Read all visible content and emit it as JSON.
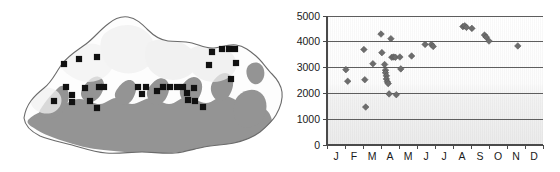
{
  "figure": {
    "panels": [
      "map-panel",
      "chart-panel"
    ]
  },
  "map": {
    "title": "Bhutan distribution map",
    "region_name": "Bhutan",
    "marker_symbol": "black-square",
    "marker_count": 40,
    "colors": {
      "outline": "#6b6b6b",
      "lowland_shading": "#8f8f8f",
      "highland_shading": "#e8e8e8",
      "marker": "#111111",
      "background": "#ffffff"
    },
    "markers": [
      {
        "x": 79,
        "y": 59
      },
      {
        "x": 64,
        "y": 64
      },
      {
        "x": 97,
        "y": 57
      },
      {
        "x": 66,
        "y": 87
      },
      {
        "x": 85,
        "y": 88
      },
      {
        "x": 99,
        "y": 87
      },
      {
        "x": 104,
        "y": 87
      },
      {
        "x": 72,
        "y": 95
      },
      {
        "x": 72,
        "y": 102
      },
      {
        "x": 54,
        "y": 101
      },
      {
        "x": 90,
        "y": 101
      },
      {
        "x": 97,
        "y": 108
      },
      {
        "x": 138,
        "y": 87
      },
      {
        "x": 146,
        "y": 87
      },
      {
        "x": 142,
        "y": 94
      },
      {
        "x": 157,
        "y": 91
      },
      {
        "x": 163,
        "y": 87
      },
      {
        "x": 170,
        "y": 87
      },
      {
        "x": 177,
        "y": 87
      },
      {
        "x": 183,
        "y": 87
      },
      {
        "x": 187,
        "y": 93
      },
      {
        "x": 194,
        "y": 88
      },
      {
        "x": 188,
        "y": 100
      },
      {
        "x": 195,
        "y": 101
      },
      {
        "x": 203,
        "y": 107
      },
      {
        "x": 212,
        "y": 52
      },
      {
        "x": 222,
        "y": 49
      },
      {
        "x": 229,
        "y": 49
      },
      {
        "x": 235,
        "y": 49
      },
      {
        "x": 209,
        "y": 65
      },
      {
        "x": 231,
        "y": 79
      },
      {
        "x": 236,
        "y": 63
      }
    ]
  },
  "chart_data": {
    "type": "scatter",
    "title": "",
    "xlabel": "",
    "ylabel": "",
    "xlim": [
      0,
      12
    ],
    "ylim": [
      0,
      5000
    ],
    "grid": true,
    "legend": false,
    "marker": "diamond",
    "marker_color": "#6d6d6d",
    "x_tick_labels": [
      "J",
      "F",
      "M",
      "A",
      "M",
      "J",
      "J",
      "A",
      "S",
      "O",
      "N",
      "D"
    ],
    "x_tick_label_full": [
      "January",
      "February",
      "March",
      "April",
      "May",
      "June",
      "July",
      "August",
      "September",
      "October",
      "November",
      "December"
    ],
    "y_tick_labels": [
      "0",
      "1000",
      "2000",
      "3000",
      "4000",
      "5000"
    ],
    "y_ticks": [
      0,
      1000,
      2000,
      3000,
      4000,
      5000
    ],
    "points": [
      {
        "month": 1.05,
        "value": 2920
      },
      {
        "month": 1.15,
        "value": 2470
      },
      {
        "month": 2.05,
        "value": 3700
      },
      {
        "month": 2.1,
        "value": 2530
      },
      {
        "month": 2.15,
        "value": 1470
      },
      {
        "month": 2.55,
        "value": 3150
      },
      {
        "month": 3.0,
        "value": 4300
      },
      {
        "month": 3.05,
        "value": 3580
      },
      {
        "month": 3.2,
        "value": 3120
      },
      {
        "month": 3.25,
        "value": 2900
      },
      {
        "month": 3.25,
        "value": 2800
      },
      {
        "month": 3.3,
        "value": 2680
      },
      {
        "month": 3.3,
        "value": 2560
      },
      {
        "month": 3.35,
        "value": 2450
      },
      {
        "month": 3.4,
        "value": 2380
      },
      {
        "month": 3.45,
        "value": 1980
      },
      {
        "month": 3.55,
        "value": 4120
      },
      {
        "month": 3.6,
        "value": 3400
      },
      {
        "month": 3.7,
        "value": 3410
      },
      {
        "month": 3.8,
        "value": 3400
      },
      {
        "month": 3.85,
        "value": 1950
      },
      {
        "month": 4.05,
        "value": 3410
      },
      {
        "month": 4.1,
        "value": 2950
      },
      {
        "month": 4.7,
        "value": 3450
      },
      {
        "month": 5.45,
        "value": 3900
      },
      {
        "month": 5.8,
        "value": 3900
      },
      {
        "month": 5.9,
        "value": 3820
      },
      {
        "month": 7.55,
        "value": 4590
      },
      {
        "month": 7.65,
        "value": 4620
      },
      {
        "month": 7.75,
        "value": 4560
      },
      {
        "month": 8.05,
        "value": 4520
      },
      {
        "month": 8.75,
        "value": 4260
      },
      {
        "month": 8.85,
        "value": 4180
      },
      {
        "month": 9.0,
        "value": 4030
      },
      {
        "month": 10.6,
        "value": 3840
      }
    ]
  }
}
